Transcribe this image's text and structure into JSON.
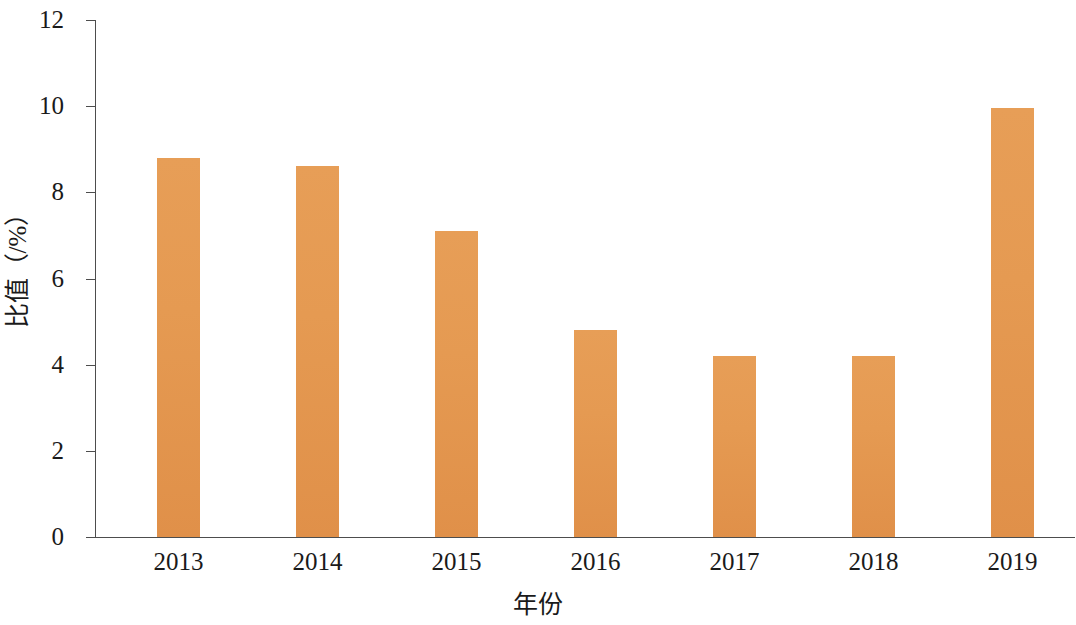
{
  "chart_data": {
    "type": "bar",
    "title": "",
    "subtitle": "",
    "xlabel": "年份",
    "ylabel": "比值（/%）",
    "categories": [
      "2013",
      "2014",
      "2015",
      "2016",
      "2017",
      "2018",
      "2019"
    ],
    "values": [
      8.8,
      8.6,
      7.1,
      4.8,
      4.2,
      4.2,
      9.95
    ],
    "series": [
      {
        "name": "比值",
        "values": [
          8.8,
          8.6,
          7.1,
          4.8,
          4.2,
          4.2,
          9.95
        ]
      }
    ],
    "ylim": [
      0,
      12
    ],
    "y_ticks": [
      "0",
      "2",
      "4",
      "6",
      "8",
      "10",
      "12"
    ],
    "y_tick_values": [
      0,
      2,
      4,
      6,
      8,
      10,
      12
    ],
    "grid": false,
    "legend": null,
    "bar_color": "#e59a52",
    "axis_color": "#4d4d4d",
    "text_color": "#1a1a1a",
    "background_color": "#ffffff"
  }
}
